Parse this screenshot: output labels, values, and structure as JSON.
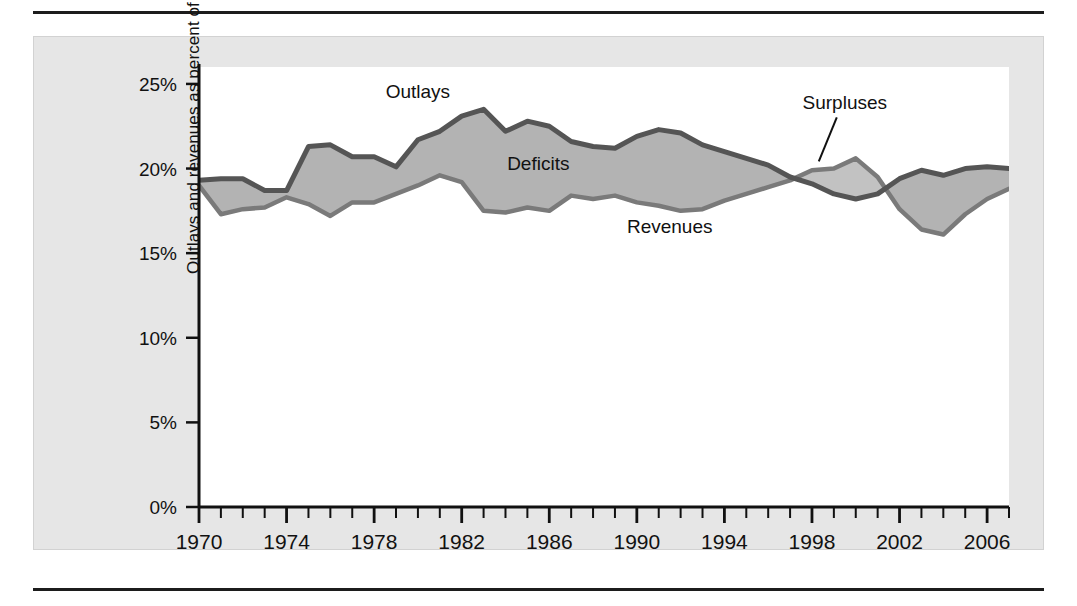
{
  "figure": {
    "name": "federal-outlays-revenues-chart",
    "background_color": "#e6e6e6",
    "plot_background_color": "#ffffff"
  },
  "chart_data": {
    "type": "area",
    "title": "",
    "subtitle": "",
    "xlabel": "",
    "ylabel": "Outlays and revenues as percent of GDP",
    "xlim": [
      1970,
      2007
    ],
    "ylim": [
      0,
      26
    ],
    "grid": false,
    "legend_position": "inline-annotations",
    "y_ticks": [
      "0%",
      "5%",
      "10%",
      "15%",
      "20%",
      "25%"
    ],
    "y_tick_values": [
      0,
      5,
      10,
      15,
      20,
      25
    ],
    "x_ticks": [
      "1970",
      "1974",
      "1978",
      "1982",
      "1986",
      "1990",
      "1994",
      "1998",
      "2002",
      "2006"
    ],
    "x_tick_values": [
      1970,
      1974,
      1978,
      1982,
      1986,
      1990,
      1994,
      1998,
      2002,
      2006
    ],
    "x_minor_tick_interval": 1,
    "x": [
      1970,
      1971,
      1972,
      1973,
      1974,
      1975,
      1976,
      1977,
      1978,
      1979,
      1980,
      1981,
      1982,
      1983,
      1984,
      1985,
      1986,
      1987,
      1988,
      1989,
      1990,
      1991,
      1992,
      1993,
      1994,
      1995,
      1996,
      1997,
      1998,
      1999,
      2000,
      2001,
      2002,
      2003,
      2004,
      2005,
      2006,
      2007
    ],
    "series": [
      {
        "name": "Outlays",
        "color": "#555555",
        "values": [
          19.3,
          19.4,
          19.4,
          18.7,
          18.7,
          21.3,
          21.4,
          20.7,
          20.7,
          20.1,
          21.7,
          22.2,
          23.1,
          23.5,
          22.2,
          22.8,
          22.5,
          21.6,
          21.3,
          21.2,
          21.9,
          22.3,
          22.1,
          21.4,
          21.0,
          20.6,
          20.2,
          19.5,
          19.1,
          18.5,
          18.2,
          18.5,
          19.4,
          19.9,
          19.6,
          20.0,
          20.1,
          20.0
        ]
      },
      {
        "name": "Revenues",
        "color": "#7a7a7a",
        "values": [
          19.0,
          17.3,
          17.6,
          17.7,
          18.3,
          17.9,
          17.2,
          18.0,
          18.0,
          18.5,
          19.0,
          19.6,
          19.2,
          17.5,
          17.4,
          17.7,
          17.5,
          18.4,
          18.2,
          18.4,
          18.0,
          17.8,
          17.5,
          17.6,
          18.1,
          18.5,
          18.9,
          19.3,
          19.9,
          20.0,
          20.6,
          19.5,
          17.6,
          16.4,
          16.1,
          17.3,
          18.2,
          18.8
        ]
      }
    ],
    "annotations": [
      {
        "label": "Outlays",
        "x_year": 1980,
        "y_value": 24.2,
        "type": "series-label"
      },
      {
        "label": "Deficits",
        "x_year": 1985.5,
        "y_value": 19.9,
        "type": "region-label"
      },
      {
        "label": "Revenues",
        "x_year": 1991.5,
        "y_value": 16.2,
        "type": "series-label"
      },
      {
        "label": "Surpluses",
        "x_year": 1999.5,
        "y_value": 23.5,
        "type": "region-label-with-leader"
      }
    ],
    "fill_colors": {
      "deficit_region": "#b3b3b3",
      "surplus_region": "#c2c2c2"
    }
  }
}
